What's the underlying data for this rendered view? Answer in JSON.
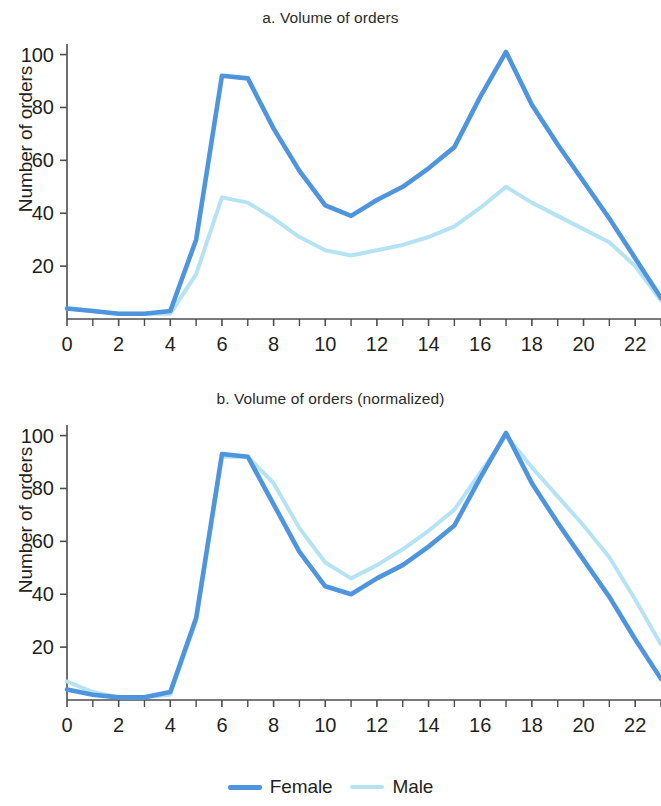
{
  "figure": {
    "background": "#ffffff"
  },
  "colors": {
    "female": "#4e95de",
    "male": "#b6e3f4",
    "axis": "#4d4d4d",
    "text": "#231f20"
  },
  "legend": {
    "position": "bottom-center",
    "items": [
      {
        "label": "Female",
        "color": "#4e95de",
        "name": "female"
      },
      {
        "label": "Male",
        "color": "#b6e3f4",
        "name": "male"
      }
    ]
  },
  "panels": [
    {
      "id": "a",
      "title": "a. Volume of orders",
      "ylabel": "Number of orders"
    },
    {
      "id": "b",
      "title": "b. Volume of orders (normalized)",
      "ylabel": "Number of orders"
    }
  ],
  "axis": {
    "x_ticks_major": [
      0,
      2,
      4,
      6,
      8,
      10,
      12,
      14,
      16,
      18,
      20,
      22
    ],
    "x_tick_labels": [
      "0",
      "2",
      "4",
      "6",
      "8",
      "10",
      "12",
      "14",
      "16",
      "18",
      "20",
      "22"
    ],
    "x_ticks_minor": [
      1,
      3,
      5,
      7,
      9,
      11,
      13,
      15,
      17,
      19,
      21,
      23
    ],
    "y_ticks": [
      20,
      40,
      60,
      80,
      100
    ],
    "y_tick_labels": [
      "20",
      "40",
      "60",
      "80",
      "100"
    ],
    "xlim": [
      0,
      23
    ],
    "ylim": [
      0,
      104
    ],
    "grid": false
  },
  "chart_data": [
    {
      "type": "line",
      "id": "a",
      "title": "a. Volume of orders",
      "xlabel": "",
      "ylabel": "Number of orders",
      "xlim": [
        0,
        23
      ],
      "ylim": [
        0,
        104
      ],
      "grid": false,
      "legend_position": "bottom-center",
      "x": [
        0,
        1,
        2,
        3,
        4,
        5,
        6,
        7,
        8,
        9,
        10,
        11,
        12,
        13,
        14,
        15,
        16,
        17,
        18,
        19,
        20,
        21,
        22,
        23
      ],
      "series": [
        {
          "name": "Female",
          "color": "#4e95de",
          "values": [
            4,
            3,
            2,
            2,
            3,
            30,
            92,
            91,
            72,
            56,
            43,
            39,
            45,
            50,
            57,
            65,
            84,
            101,
            81,
            66,
            52,
            38,
            23,
            8
          ]
        },
        {
          "name": "Male",
          "color": "#b6e3f4",
          "values": [
            4,
            3,
            2,
            2,
            2,
            17,
            46,
            44,
            38,
            31,
            26,
            24,
            26,
            28,
            31,
            35,
            42,
            50,
            44,
            39,
            34,
            29,
            20,
            7
          ]
        }
      ]
    },
    {
      "type": "line",
      "id": "b",
      "title": "b. Volume of orders (normalized)",
      "xlabel": "",
      "ylabel": "Number of orders",
      "xlim": [
        0,
        23
      ],
      "ylim": [
        0,
        104
      ],
      "grid": false,
      "legend_position": "bottom-center",
      "x": [
        0,
        1,
        2,
        3,
        4,
        5,
        6,
        7,
        8,
        9,
        10,
        11,
        12,
        13,
        14,
        15,
        16,
        17,
        18,
        19,
        20,
        21,
        22,
        23
      ],
      "series": [
        {
          "name": "Female",
          "color": "#4e95de",
          "values": [
            4,
            2,
            1,
            1,
            3,
            31,
            93,
            92,
            74,
            56,
            43,
            40,
            46,
            51,
            58,
            66,
            84,
            101,
            82,
            67,
            53,
            39,
            23,
            8
          ]
        },
        {
          "name": "Male",
          "color": "#b6e3f4",
          "values": [
            7,
            3,
            1,
            1,
            2,
            30,
            92,
            92,
            82,
            65,
            52,
            46,
            51,
            57,
            64,
            72,
            86,
            100,
            88,
            77,
            66,
            54,
            38,
            21
          ]
        }
      ]
    }
  ]
}
